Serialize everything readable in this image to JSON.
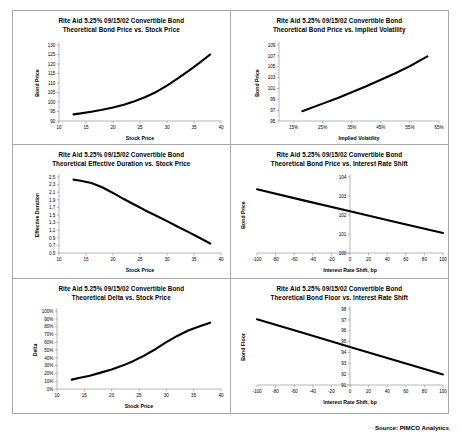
{
  "document": {
    "source_note": "Source: PIMCO Analytics"
  },
  "common": {
    "security_line": "Rite Aid 5.25% 09/15/02 Convertible Bond"
  },
  "chart_data": [
    {
      "id": "bond-price-vs-stock-price",
      "type": "line",
      "title": "Rite Aid 5.25% 09/15/02 Convertible Bond",
      "subtitle": "Theoretical Bond Price vs. Stock Price",
      "xlabel": "Stock Price",
      "ylabel": "Bond Price",
      "xlim": [
        10,
        40
      ],
      "ylim": [
        90,
        130
      ],
      "xticks": [
        10,
        15,
        20,
        25,
        30,
        35,
        40
      ],
      "yticks": [
        90,
        95,
        100,
        105,
        110,
        115,
        120,
        125,
        130
      ],
      "xtick_labels": [
        "10",
        "15",
        "20",
        "25",
        "30",
        "35",
        "40"
      ],
      "ytick_labels": [
        "90",
        "95",
        "100",
        "105",
        "110",
        "115",
        "120",
        "125",
        "130"
      ],
      "grid": false,
      "legend": "none",
      "x": [
        12.7,
        14,
        16,
        18,
        20,
        22,
        24,
        26,
        28,
        30,
        32,
        34,
        36,
        38
      ],
      "y": [
        93.5,
        94.0,
        94.9,
        95.9,
        97.1,
        98.6,
        100.4,
        102.6,
        105.3,
        108.6,
        112.4,
        116.4,
        120.6,
        125.0
      ]
    },
    {
      "id": "bond-price-vs-implied-volatility",
      "type": "line",
      "title": "Rite Aid 5.25% 09/15/02 Convertible Bond",
      "subtitle": "Theoretical Bond Price vs. Implied Volatility",
      "xlabel": "Implied Volatility",
      "ylabel": "Bond Price",
      "xlim": [
        10,
        65
      ],
      "ylim": [
        95,
        109
      ],
      "xticks": [
        15,
        25,
        35,
        45,
        55,
        65
      ],
      "yticks": [
        95,
        97,
        99,
        101,
        103,
        105,
        107,
        109
      ],
      "xtick_labels": [
        "15%",
        "25%",
        "35%",
        "45%",
        "55%",
        "65%"
      ],
      "ytick_labels": [
        "95",
        "97",
        "99",
        "101",
        "103",
        "105",
        "107",
        "109"
      ],
      "grid": false,
      "legend": "none",
      "x": [
        18,
        25,
        30,
        35,
        40,
        45,
        50,
        55,
        61
      ],
      "y": [
        96.8,
        98.2,
        99.2,
        100.3,
        101.4,
        102.6,
        103.8,
        105.1,
        106.9
      ]
    },
    {
      "id": "effective-duration-vs-stock-price",
      "type": "line",
      "title": "Rite Aid 5.25% 09/15/02 Convertible Bond",
      "subtitle": "Theoretical Effective Duration vs. Stock Price",
      "xlabel": "Stock Price",
      "ylabel": "Effective Duration",
      "xlim": [
        10,
        40
      ],
      "ylim": [
        0.5,
        2.5
      ],
      "xticks": [
        10,
        15,
        20,
        25,
        30,
        35,
        40
      ],
      "yticks": [
        0.5,
        0.7,
        0.9,
        1.1,
        1.3,
        1.5,
        1.7,
        1.9,
        2.1,
        2.3,
        2.5
      ],
      "xtick_labels": [
        "10",
        "15",
        "20",
        "25",
        "30",
        "35",
        "40"
      ],
      "ytick_labels": [
        "0.5",
        "0.7",
        "0.9",
        "1.1",
        "1.3",
        "1.5",
        "1.7",
        "1.9",
        "2.1",
        "2.3",
        "2.5"
      ],
      "grid": false,
      "legend": "none",
      "x": [
        12.7,
        14,
        16,
        18,
        20,
        22,
        24,
        26,
        28,
        30,
        32,
        34,
        36,
        38
      ],
      "y": [
        2.43,
        2.4,
        2.34,
        2.23,
        2.08,
        1.92,
        1.77,
        1.62,
        1.48,
        1.34,
        1.19,
        1.05,
        0.9,
        0.75
      ]
    },
    {
      "id": "bond-price-vs-interest-rate-shift",
      "type": "line",
      "title": "Rite Aid 5.25% 09/15/02 Convertible Bond",
      "subtitle": "Theoretical Bond Price vs. Interest Rate Shift",
      "xlabel": "Interest Rate Shift, bp",
      "ylabel": "Bond Price",
      "xlim": [
        -100,
        100
      ],
      "ylim": [
        100,
        104
      ],
      "xticks": [
        -100,
        -80,
        -60,
        -40,
        -20,
        0,
        20,
        40,
        60,
        80,
        100
      ],
      "yticks": [
        100,
        101,
        102,
        103,
        104
      ],
      "xtick_labels": [
        "-100",
        "-80",
        "-60",
        "-40",
        "-20",
        "0",
        "20",
        "40",
        "60",
        "80",
        "100"
      ],
      "ytick_labels": [
        "100",
        "101",
        "102",
        "103",
        "104",
        "104"
      ],
      "grid": false,
      "legend": "none",
      "x": [
        -100,
        -50,
        0,
        50,
        100
      ],
      "y": [
        103.35,
        102.77,
        102.2,
        101.62,
        101.05
      ]
    },
    {
      "id": "delta-vs-stock-price",
      "type": "line",
      "title": "Rite Aid 5.25% 09/15/02 Convertible Bond",
      "subtitle": "Theoretical Delta vs. Stock Price",
      "xlabel": "Stock Price",
      "ylabel": "Delta",
      "xlim": [
        10,
        40
      ],
      "ylim": [
        0,
        100
      ],
      "xticks": [
        10,
        15,
        20,
        25,
        30,
        35,
        40
      ],
      "yticks": [
        0,
        10,
        20,
        30,
        40,
        50,
        60,
        70,
        80,
        90,
        100
      ],
      "xtick_labels": [
        "10",
        "15",
        "20",
        "25",
        "30",
        "35",
        "40"
      ],
      "ytick_labels": [
        "0%",
        "10%",
        "20%",
        "30%",
        "40%",
        "50%",
        "60%",
        "70%",
        "80%",
        "90%",
        "100%"
      ],
      "grid": false,
      "legend": "none",
      "x": [
        12.7,
        14,
        16,
        18,
        20,
        22,
        24,
        26,
        28,
        30,
        32,
        34,
        36,
        38
      ],
      "y": [
        12,
        14,
        17,
        21,
        25,
        30,
        36,
        43,
        51,
        60,
        68,
        75,
        80,
        85
      ]
    },
    {
      "id": "bond-floor-vs-interest-rate-shift",
      "type": "line",
      "title": "Rite Aid 5.25% 09/15/02 Convertible Bond",
      "subtitle": "Theoretical Bond Floor vs. Interest Rate Shift",
      "xlabel": "Interest Rate Shift, bp",
      "ylabel": "Bond Floor",
      "xlim": [
        -100,
        100
      ],
      "ylim": [
        91,
        98
      ],
      "xticks": [
        -100,
        -80,
        -60,
        -40,
        -20,
        0,
        20,
        40,
        60,
        80,
        100
      ],
      "yticks": [
        91,
        92,
        93,
        94,
        95,
        96,
        97,
        98
      ],
      "xtick_labels": [
        "-100",
        "-80",
        "-60",
        "-40",
        "-20",
        "0",
        "20",
        "40",
        "60",
        "80",
        "100"
      ],
      "ytick_labels": [
        "91",
        "92",
        "93",
        "94",
        "95",
        "96",
        "97",
        "98"
      ],
      "grid": false,
      "legend": "none",
      "x": [
        -100,
        -50,
        0,
        50,
        100
      ],
      "y": [
        97.05,
        95.78,
        94.5,
        93.24,
        91.97
      ]
    }
  ]
}
